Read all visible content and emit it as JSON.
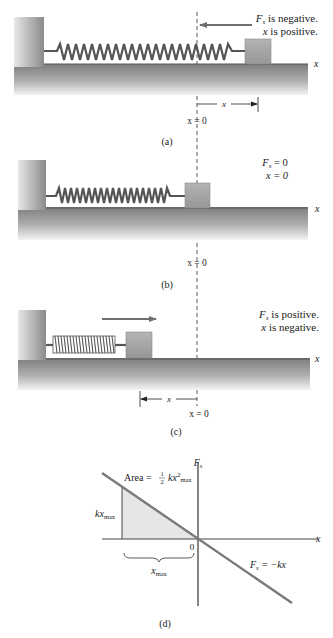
{
  "panels": {
    "a": {
      "caption": "(a)",
      "force_text": "is negative.",
      "force_symbol": "F",
      "force_sub": "s",
      "x_text": "is positive.",
      "x_symbol": "x",
      "axis_label": "x",
      "origin_label": "x = 0",
      "displacement_label": "x"
    },
    "b": {
      "caption": "(b)",
      "force_symbol": "F",
      "force_sub": "s",
      "force_value": "= 0",
      "x_line": "x = 0",
      "axis_label": "x",
      "origin_label": "x = 0"
    },
    "c": {
      "caption": "(c)",
      "force_text": "is positive.",
      "force_symbol": "F",
      "force_sub": "s",
      "x_text": "is negative.",
      "x_symbol": "x",
      "axis_label": "x",
      "origin_label": "x = 0",
      "displacement_label": "x"
    },
    "d": {
      "caption": "(d)",
      "y_axis_label": "F",
      "y_axis_sub": "s",
      "x_axis_label": "x",
      "origin": "0",
      "area_prefix": "Area =",
      "area_frac_num": "1",
      "area_frac_den": "2",
      "area_kx": "kx",
      "area_sup": "2",
      "area_sub": "max",
      "kxmax_main": "kx",
      "kxmax_sub": "max",
      "xmax_main": "x",
      "xmax_sub": "max",
      "law_lhs": "F",
      "law_sub": "s",
      "law_rhs": "= −kx"
    }
  },
  "colors": {
    "block": "#a3a3a3",
    "floor_dark": "#7a7a7a",
    "spring": "#555555",
    "arrow": "#6f6f6f",
    "shade": "#e6e6e6"
  }
}
